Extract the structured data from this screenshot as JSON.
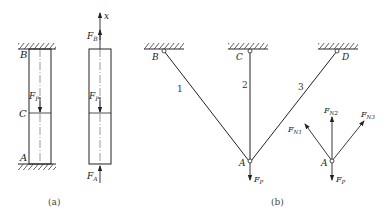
{
  "figure_a": {
    "caption": "(a)",
    "left_bar": {
      "top_label": "B",
      "middle_label": "C",
      "bottom_label": "A",
      "force_label": "F",
      "force_sub": "P"
    },
    "free_body": {
      "axis_label": "x",
      "top_force": "F",
      "top_force_sub": "B",
      "middle_force": "F",
      "middle_force_sub": "P",
      "bottom_force": "F",
      "bottom_force_sub": "A"
    }
  },
  "figure_b": {
    "caption": "(b)",
    "supports": [
      "B",
      "C",
      "D"
    ],
    "members": [
      "1",
      "2",
      "3"
    ],
    "joint": "A",
    "load": "F",
    "load_sub": "P",
    "free_body": {
      "joint": "A",
      "forces": [
        {
          "main": "F",
          "sub": "N1"
        },
        {
          "main": "F",
          "sub": "N2"
        },
        {
          "main": "F",
          "sub": "N3"
        }
      ],
      "load": "F",
      "load_sub": "P"
    }
  }
}
